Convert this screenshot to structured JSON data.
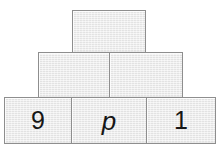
{
  "figure": {
    "kind": "block-pyramid",
    "background_color": "#ffffff",
    "block_fill_color": "#e9e9e9",
    "block_border_color": "#8e8e8e",
    "label_color": "#161616",
    "rows": [
      {
        "row_name": "top-row",
        "blocks": [
          {
            "label": "",
            "style": "plain"
          }
        ]
      },
      {
        "row_name": "middle-row",
        "blocks": [
          {
            "label": "",
            "style": "plain"
          },
          {
            "label": "",
            "style": "plain"
          }
        ]
      },
      {
        "row_name": "bottom-row",
        "blocks": [
          {
            "label": "9",
            "style": "plain"
          },
          {
            "label": "p",
            "style": "italic"
          },
          {
            "label": "1",
            "style": "plain"
          }
        ]
      }
    ]
  }
}
